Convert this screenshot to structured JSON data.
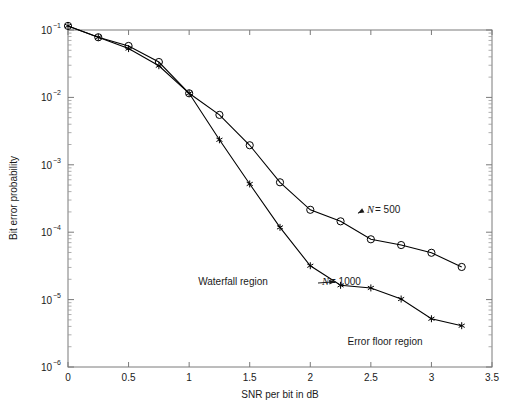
{
  "chart_data": {
    "type": "line",
    "title": "",
    "xlabel": "SNR per bit in dB",
    "ylabel": "Bit error probability",
    "xlim": [
      0,
      3.5
    ],
    "ylim": [
      1e-06,
      0.1
    ],
    "yscale": "log",
    "grid": false,
    "legend_position": "inline-annotations",
    "xticks": [
      0,
      0.5,
      1,
      1.5,
      2,
      2.5,
      3,
      3.5
    ],
    "xtick_labels": [
      "0",
      "0.5",
      "1",
      "1.5",
      "2",
      "2.5",
      "3",
      "3.5"
    ],
    "yticks": [
      0.1,
      0.01,
      0.001,
      0.0001,
      1e-05,
      1e-06
    ],
    "ytick_labels": [
      "10-1",
      "10-2",
      "10-3",
      "10-4",
      "10-5",
      "10-6"
    ],
    "ytick_bases": [
      "10",
      "10",
      "10",
      "10",
      "10",
      "10"
    ],
    "ytick_exponents": [
      "−1",
      "−2",
      "−3",
      "−4",
      "−5",
      "−6"
    ],
    "series": [
      {
        "name": "N = 500",
        "marker": "circle",
        "color": "#000000",
        "x": [
          0,
          0.25,
          0.5,
          0.75,
          1.0,
          1.25,
          1.5,
          1.75,
          2.0,
          2.25,
          2.5,
          2.75,
          3.0,
          3.25
        ],
        "y": [
          0.115,
          0.078,
          0.058,
          0.0335,
          0.0115,
          0.0055,
          0.00195,
          0.00055,
          0.000215,
          0.000145,
          7.85e-05,
          6.45e-05,
          4.95e-05,
          3.05e-05
        ]
      },
      {
        "name": "N = 1000",
        "marker": "star",
        "color": "#000000",
        "x": [
          0,
          0.25,
          0.5,
          0.75,
          1.0,
          1.25,
          1.5,
          1.75,
          2.0,
          2.25,
          2.5,
          2.75,
          3.0,
          3.25
        ],
        "y": [
          0.115,
          0.078,
          0.053,
          0.0295,
          0.0115,
          0.00235,
          0.00052,
          0.000118,
          3.18e-05,
          1.63e-05,
          1.49e-05,
          1.02e-05,
          5.2e-06,
          4.1e-06
        ]
      }
    ],
    "annotations": [
      {
        "text": "Waterfall region",
        "x_data": 1.32,
        "y_data": 2.65e-05,
        "style": "plain"
      },
      {
        "text": "Error floor region",
        "x_data": 2.62,
        "y_data": 5e-06,
        "style": "plain"
      },
      {
        "text": "N = 500",
        "x_data": 2.84,
        "y_data": 0.000196,
        "style": "italic-N",
        "arrow_to": [
          2.41,
          0.000167
        ]
      },
      {
        "text": "N = 1000",
        "x_data": 2.44,
        "y_data": 2.15e-05,
        "style": "italic-N",
        "arrow_to": [
          2.19,
          1.66e-05
        ]
      }
    ]
  },
  "axis": {
    "x_title": "SNR per bit in dB",
    "y_title": "Bit error probability"
  },
  "annotation_labels": {
    "waterfall": "Waterfall region",
    "error_floor": "Error floor region",
    "n500_var": "N",
    "n500_eq": "= 500",
    "n1000_var": "N",
    "n1000_eq": "= 1000"
  }
}
